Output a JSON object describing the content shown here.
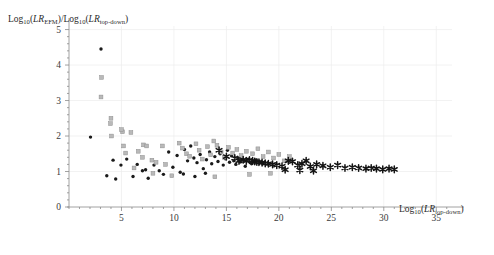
{
  "figure": {
    "name": "scatter-plot-lr-ratio",
    "background": "#ffffff"
  },
  "chart_data": {
    "type": "scatter",
    "title": "",
    "subtitle": "",
    "xlabel": "Log10(LRtop-down)",
    "ylabel": "Log10(LREFM)/Log10(LRtop-down)",
    "xlabel_parts": {
      "log": "Log",
      "log_sub": "10",
      "open": "(",
      "lr": "LR",
      "lr_sub": "top-down",
      "close": ")"
    },
    "ylabel_parts": {
      "log": "Log",
      "log_sub": "10",
      "open": "(",
      "lr": "LR",
      "lr_sub": "EFM",
      "close": ")",
      "slash": "/",
      "log2": "Log",
      "log2_sub": "10",
      "open2": "(",
      "lr2": "LR",
      "lr2_sub": "top-down",
      "close2": ")"
    },
    "xlim": [
      0,
      36.5
    ],
    "ylim": [
      0,
      5.1
    ],
    "xticks": [
      5,
      10,
      15,
      20,
      25,
      30,
      35
    ],
    "yticks": [
      0,
      1,
      2,
      3,
      4,
      5
    ],
    "xtick_labels": [
      "5",
      "10",
      "15",
      "20",
      "25",
      "30",
      "35"
    ],
    "ytick_labels": [
      "0",
      "1",
      "2",
      "3",
      "4",
      "5"
    ],
    "origin_label": "0",
    "grid": true,
    "grid_color": "#ececec",
    "axis_color": "#8a8a8a",
    "legend": "none",
    "series": [
      {
        "name": "filled-circles",
        "marker": "circle",
        "color": "#1a1a1a",
        "points": [
          [
            3.05,
            4.45
          ],
          [
            2.05,
            1.97
          ],
          [
            4.2,
            1.32
          ],
          [
            4.95,
            1.18
          ],
          [
            3.6,
            0.88
          ],
          [
            4.45,
            0.79
          ],
          [
            5.5,
            1.35
          ],
          [
            6.1,
            0.86
          ],
          [
            6.5,
            1.2
          ],
          [
            7.0,
            1.02
          ],
          [
            7.3,
            1.05
          ],
          [
            7.55,
            0.81
          ],
          [
            8.1,
            1.18
          ],
          [
            8.6,
            1.02
          ],
          [
            9.0,
            0.92
          ],
          [
            9.5,
            1.55
          ],
          [
            9.9,
            1.12
          ],
          [
            10.3,
            1.45
          ],
          [
            10.6,
            0.98
          ],
          [
            11.0,
            1.62
          ],
          [
            11.3,
            1.3
          ],
          [
            11.6,
            1.72
          ],
          [
            11.9,
            1.38
          ],
          [
            12.2,
            1.25
          ],
          [
            12.5,
            1.48
          ],
          [
            12.8,
            1.08
          ],
          [
            13.1,
            1.33
          ],
          [
            13.4,
            1.55
          ],
          [
            13.6,
            1.22
          ],
          [
            13.9,
            1.42
          ],
          [
            14.2,
            1.28
          ],
          [
            14.4,
            1.5
          ],
          [
            14.7,
            1.18
          ],
          [
            14.9,
            1.36
          ],
          [
            15.1,
            1.6
          ],
          [
            15.3,
            1.26
          ],
          [
            15.5,
            1.44
          ],
          [
            15.7,
            1.3
          ],
          [
            15.9,
            1.2
          ],
          [
            16.1,
            1.38
          ],
          [
            16.3,
            1.27
          ],
          [
            16.5,
            1.33
          ],
          [
            16.8,
            1.15
          ],
          [
            17.1,
            1.35
          ],
          [
            17.4,
            1.22
          ],
          [
            17.8,
            1.3
          ],
          [
            18.2,
            1.26
          ],
          [
            10.9,
            0.93
          ],
          [
            12.0,
            0.86
          ],
          [
            13.0,
            0.95
          ]
        ]
      },
      {
        "name": "open-squares",
        "marker": "square",
        "color": "#b9b9b9",
        "points": [
          [
            3.1,
            3.65
          ],
          [
            3.05,
            3.1
          ],
          [
            4.0,
            2.5
          ],
          [
            3.95,
            2.35
          ],
          [
            4.05,
            2.0
          ],
          [
            5.1,
            2.12
          ],
          [
            5.0,
            2.18
          ],
          [
            5.9,
            2.1
          ],
          [
            5.2,
            1.72
          ],
          [
            5.4,
            1.52
          ],
          [
            6.6,
            1.57
          ],
          [
            7.1,
            1.75
          ],
          [
            7.4,
            1.72
          ],
          [
            7.0,
            1.4
          ],
          [
            7.9,
            1.32
          ],
          [
            8.3,
            1.26
          ],
          [
            8.9,
            1.72
          ],
          [
            9.2,
            1.2
          ],
          [
            9.8,
            0.88
          ],
          [
            10.5,
            1.8
          ],
          [
            10.8,
            1.66
          ],
          [
            11.2,
            1.5
          ],
          [
            11.5,
            1.43
          ],
          [
            12.1,
            1.78
          ],
          [
            12.4,
            1.6
          ],
          [
            12.7,
            1.35
          ],
          [
            13.2,
            1.7
          ],
          [
            13.5,
            1.47
          ],
          [
            13.8,
            1.86
          ],
          [
            13.9,
            0.85
          ],
          [
            14.1,
            1.74
          ],
          [
            14.5,
            1.55
          ],
          [
            14.8,
            1.4
          ],
          [
            15.2,
            1.68
          ],
          [
            15.6,
            1.52
          ],
          [
            16.0,
            1.62
          ],
          [
            16.4,
            1.45
          ],
          [
            16.9,
            1.57
          ],
          [
            17.5,
            1.5
          ],
          [
            18.0,
            1.64
          ],
          [
            18.5,
            1.42
          ],
          [
            19.0,
            1.55
          ],
          [
            19.5,
            1.38
          ],
          [
            20.0,
            1.48
          ],
          [
            20.5,
            1.3
          ],
          [
            21.0,
            1.42
          ],
          [
            17.2,
            0.92
          ],
          [
            19.2,
            0.95
          ],
          [
            6.2,
            1.1
          ],
          [
            8.0,
            0.95
          ]
        ]
      },
      {
        "name": "stars",
        "marker": "star",
        "color": "#141414",
        "points": [
          [
            14.3,
            1.6
          ],
          [
            15.0,
            1.42
          ],
          [
            15.8,
            1.38
          ],
          [
            16.2,
            1.3
          ],
          [
            16.6,
            1.33
          ],
          [
            16.9,
            1.3
          ],
          [
            17.2,
            1.32
          ],
          [
            17.5,
            1.3
          ],
          [
            17.7,
            1.28
          ],
          [
            17.9,
            1.27
          ],
          [
            18.1,
            1.26
          ],
          [
            18.4,
            1.25
          ],
          [
            18.7,
            1.23
          ],
          [
            19.0,
            1.22
          ],
          [
            19.4,
            1.2
          ],
          [
            19.8,
            1.18
          ],
          [
            20.3,
            1.15
          ],
          [
            20.9,
            1.3
          ],
          [
            21.3,
            1.28
          ],
          [
            21.8,
            1.18
          ],
          [
            22.2,
            1.22
          ],
          [
            22.6,
            1.3
          ],
          [
            23.0,
            1.14
          ],
          [
            23.6,
            1.2
          ],
          [
            24.2,
            1.16
          ],
          [
            24.9,
            1.12
          ],
          [
            25.6,
            1.18
          ],
          [
            26.3,
            1.1
          ],
          [
            27.0,
            1.12
          ],
          [
            27.6,
            1.1
          ],
          [
            28.3,
            1.08
          ],
          [
            28.8,
            1.1
          ],
          [
            29.3,
            1.08
          ],
          [
            29.9,
            1.06
          ],
          [
            30.5,
            1.08
          ],
          [
            31.0,
            1.06
          ],
          [
            20.6,
            1.05
          ],
          [
            22.0,
            1.04
          ],
          [
            23.3,
            1.02
          ]
        ]
      }
    ]
  }
}
